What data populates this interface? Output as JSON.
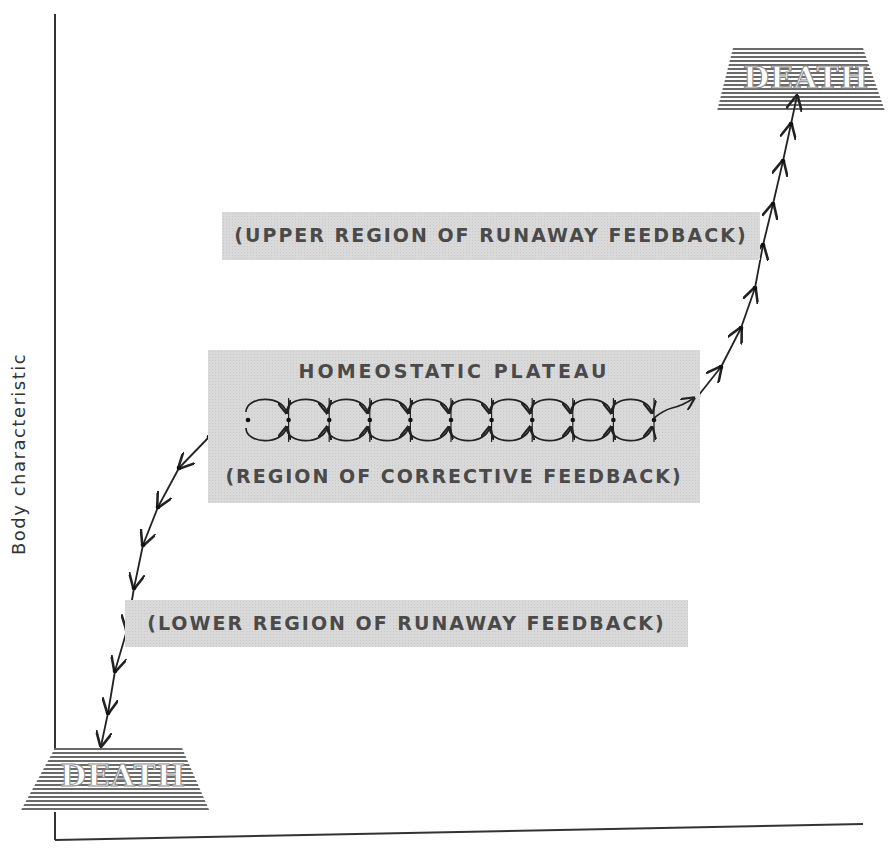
{
  "diagram": {
    "y_axis_label": "Body characteristic",
    "x_axis_label": "",
    "death_top": {
      "label": "DEATH"
    },
    "death_bottom": {
      "label": "DEATH"
    },
    "upper_region": {
      "label": "(UPPER REGION OF RUNAWAY FEEDBACK)"
    },
    "plateau": {
      "title": "HOMEOSTATIC PLATEAU",
      "subtitle": "(REGION OF CORRECTIVE FEEDBACK)",
      "loop_count": 10
    },
    "lower_region": {
      "label": "(LOWER REGION OF RUNAWAY FEEDBACK)"
    },
    "colors": {
      "ink": "#222222",
      "box_fill": "#d9d9d9",
      "box_text": "#4a4a4a",
      "hatch": "#555555"
    }
  }
}
